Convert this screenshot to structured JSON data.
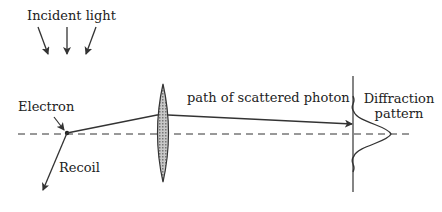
{
  "diagram": {
    "labels": {
      "incident_light": "Incident light",
      "electron": "Electron",
      "recoil": "Recoil",
      "scattered_path": "path of scattered photon",
      "diffraction_line1": "Diffraction",
      "diffraction_line2": "pattern"
    },
    "colors": {
      "stroke": "#333333",
      "lens_fill": "#aaaaaa",
      "background": "#ffffff"
    }
  }
}
